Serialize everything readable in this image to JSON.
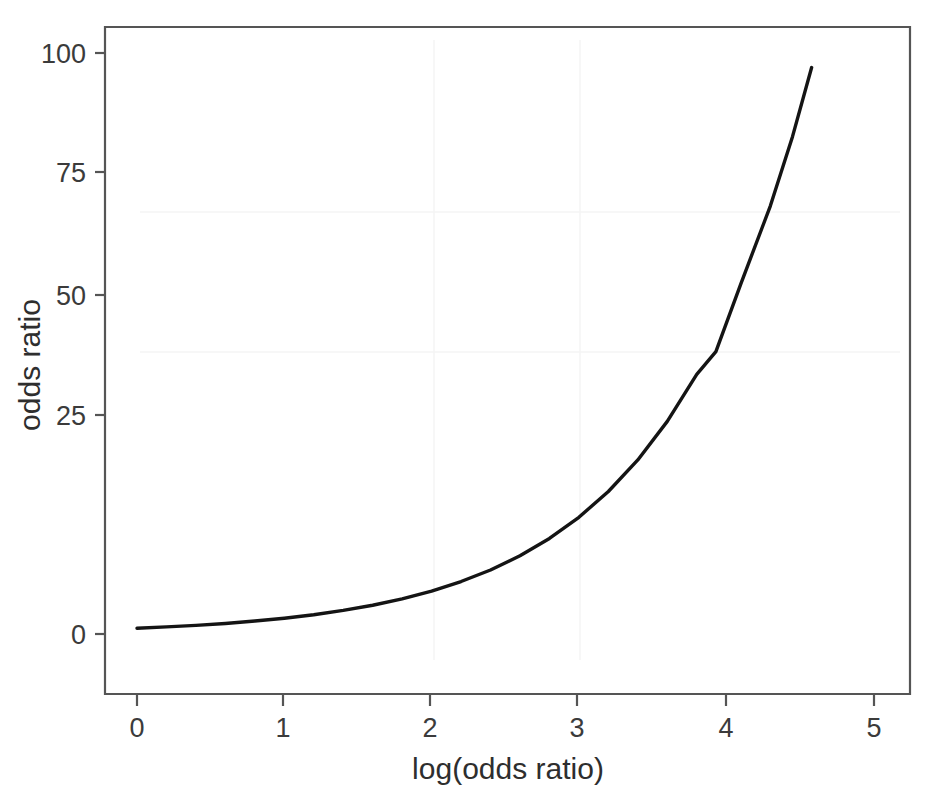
{
  "figure": {
    "background_color": "#ffffff",
    "ink_color": "#141414",
    "axis_color": "#555555",
    "text_color": "#3b3b3b"
  },
  "chart_data": {
    "type": "line",
    "title": "",
    "subtitle": "",
    "xlabel": "log(odds ratio)",
    "ylabel": "odds ratio",
    "xlim": [
      -0.22,
      5.25
    ],
    "ylim": [
      -4.5,
      110
    ],
    "xticks": [
      0,
      1,
      2,
      3,
      4,
      5
    ],
    "xtick_labels": [
      "0",
      "1",
      "2",
      "3",
      "4",
      "5"
    ],
    "yticks": [
      0,
      25,
      50,
      75,
      100
    ],
    "ytick_labels": [
      "0",
      "25",
      "50",
      "75",
      "100"
    ],
    "grid": false,
    "legend": null,
    "legend_position": "none",
    "annotations": [],
    "series": [
      {
        "name": "odds ratio = exp(log odds ratio)",
        "color": "#141414",
        "line_width": 3.4,
        "x": [
          0.0,
          0.2,
          0.4,
          0.6,
          0.8,
          1.0,
          1.2,
          1.4,
          1.6,
          1.8,
          2.0,
          2.2,
          2.4,
          2.6,
          2.8,
          3.0,
          3.2,
          3.4,
          3.6,
          3.8,
          3.93,
          4.1,
          4.3,
          4.45,
          4.58
        ],
        "y": [
          1.0,
          1.22,
          1.49,
          1.82,
          2.23,
          2.72,
          3.32,
          4.06,
          4.95,
          6.05,
          7.39,
          9.03,
          11.02,
          13.46,
          16.44,
          20.09,
          24.53,
          29.96,
          36.6,
          44.7,
          48.6,
          60.3,
          73.7,
          85.6,
          97.5
        ]
      }
    ]
  },
  "axes": {
    "x_tick_values": [
      "0",
      "1",
      "2",
      "3",
      "4",
      "5"
    ],
    "y_tick_values": [
      "0",
      "25",
      "50",
      "75",
      "100"
    ],
    "x_axis_title": "log(odds ratio)",
    "y_axis_title": "odds ratio"
  }
}
